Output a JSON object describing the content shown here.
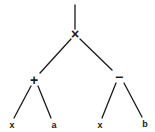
{
  "diagram": {
    "type": "expression-tree",
    "expression": "(x + a) × (x − b)",
    "colors": {
      "stroke": "#1a1a1a",
      "background": "#ffffff"
    },
    "nodes": {
      "root": {
        "label": "×",
        "x": 75,
        "y": 34
      },
      "plus": {
        "label": "+",
        "x": 34,
        "y": 80
      },
      "minus": {
        "label": "−",
        "x": 119,
        "y": 77
      },
      "leaf_x1": {
        "label": "x",
        "x": 12,
        "y": 128
      },
      "leaf_a": {
        "label": "a",
        "x": 54,
        "y": 128
      },
      "leaf_x2": {
        "label": "x",
        "x": 100,
        "y": 128
      },
      "leaf_b": {
        "label": "b",
        "x": 145,
        "y": 127
      }
    },
    "edges": [
      {
        "from": "top",
        "to": "root"
      },
      {
        "from": "root",
        "to": "plus"
      },
      {
        "from": "root",
        "to": "minus"
      },
      {
        "from": "plus",
        "to": "leaf_x1"
      },
      {
        "from": "plus",
        "to": "leaf_a"
      },
      {
        "from": "minus",
        "to": "leaf_x2"
      },
      {
        "from": "minus",
        "to": "leaf_b"
      }
    ]
  }
}
